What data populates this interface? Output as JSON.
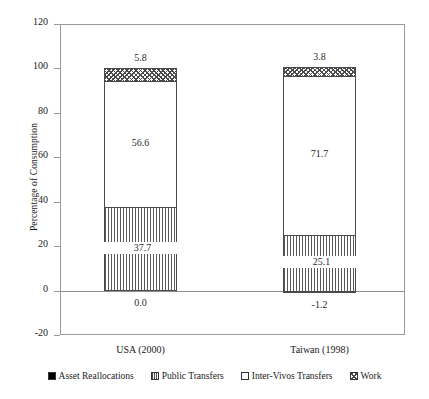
{
  "chart_data": {
    "type": "bar",
    "subtype": "stacked-bar",
    "title": "",
    "xlabel": "",
    "ylabel": "Percentage of Consumption",
    "ylim": [
      -20,
      120
    ],
    "ytick_step": 20,
    "yticks": [
      "120",
      "100",
      "80",
      "60",
      "40",
      "20",
      "0",
      "-20"
    ],
    "grid": false,
    "legend_position": "bottom",
    "categories": [
      "USA (2000)",
      "Taiwan (1998)"
    ],
    "series": [
      {
        "name": "Asset Reallocations",
        "pattern": "solid-black",
        "values": [
          0.0,
          -1.2
        ]
      },
      {
        "name": "Public Transfers",
        "pattern": "vertical-lines",
        "values": [
          37.7,
          25.1
        ]
      },
      {
        "name": "Inter-Vivos Transfers",
        "pattern": "white",
        "values": [
          56.6,
          71.7
        ]
      },
      {
        "name": "Work",
        "pattern": "diagonal-hatch",
        "values": [
          5.8,
          3.8
        ]
      }
    ],
    "value_labels": {
      "USA (2000)": {
        "asset": "0.0",
        "public": "37.7",
        "intervivos": "56.6",
        "work": "5.8"
      },
      "Taiwan (1998)": {
        "asset": "-1.2",
        "public": "25.1",
        "intervivos": "71.7",
        "work": "3.8"
      }
    }
  },
  "legend": {
    "items": [
      {
        "label": "Asset Reallocations"
      },
      {
        "label": "Public Transfers"
      },
      {
        "label": "Inter-Vivos Transfers"
      },
      {
        "label": "Work"
      }
    ]
  }
}
